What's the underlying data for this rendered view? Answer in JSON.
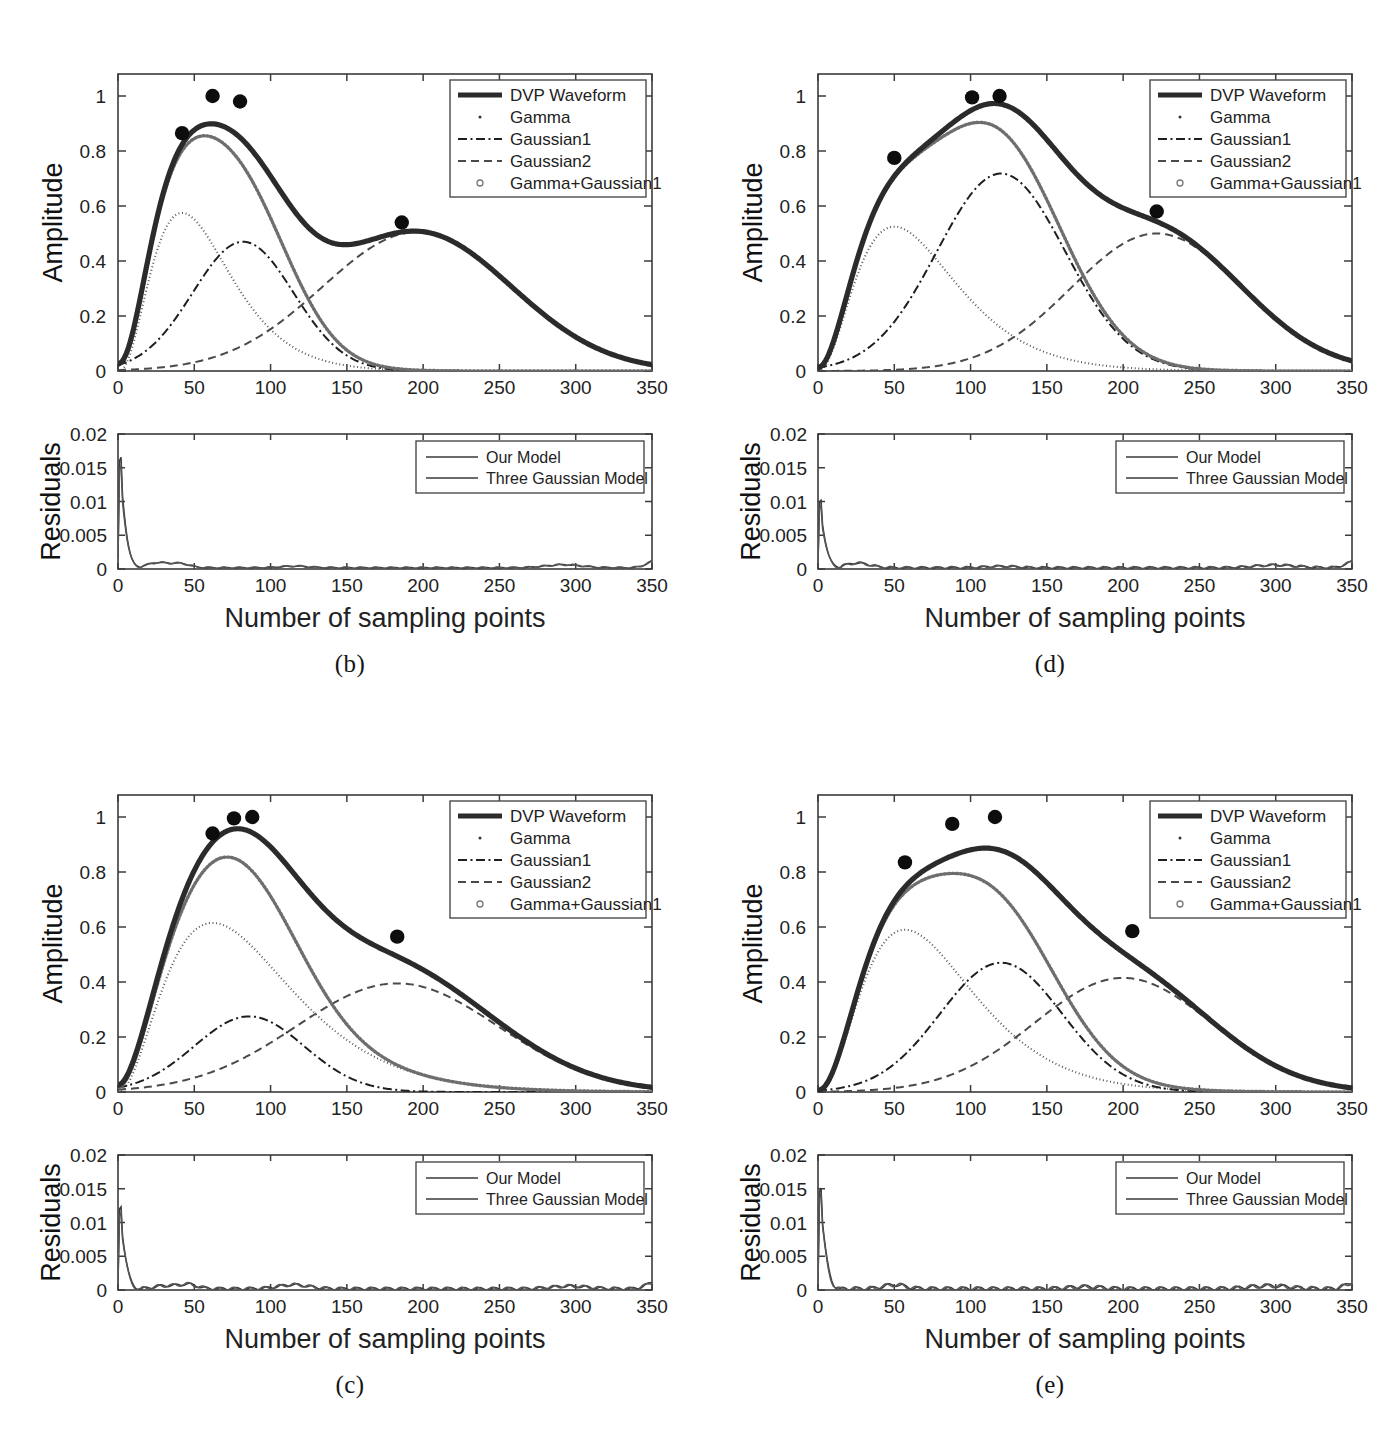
{
  "figure": {
    "panels": [
      {
        "id": "panel-b",
        "caption": "(b)",
        "amplitude": {
          "ylabel": "Amplitude",
          "yticks": [
            "0",
            "0.2",
            "0.4",
            "0.6",
            "0.8",
            "1"
          ],
          "ytickvals": [
            0,
            0.2,
            0.4,
            0.6,
            0.8,
            1
          ],
          "xticks": [
            "0",
            "50",
            "100",
            "150",
            "200",
            "250",
            "300",
            "350"
          ],
          "xtickvals": [
            0,
            50,
            100,
            150,
            200,
            250,
            300,
            350
          ],
          "xlim": [
            0,
            350
          ],
          "ylim": [
            0,
            1.08
          ],
          "legend": [
            {
              "label": "DVP Waveform",
              "style": "solid-thick"
            },
            {
              "label": "Gamma",
              "style": "dot"
            },
            {
              "label": "Gaussian1",
              "style": "dashdot"
            },
            {
              "label": "Gaussian2",
              "style": "dashed"
            },
            {
              "label": "Gamma+Gaussian1",
              "style": "circle"
            }
          ]
        },
        "residuals": {
          "ylabel": "Residuals",
          "xlabel": "Number of sampling points",
          "yticks": [
            "0",
            "0.005",
            "0.01",
            "0.015",
            "0.02"
          ],
          "ytickvals": [
            0,
            0.005,
            0.01,
            0.015,
            0.02
          ],
          "xticks": [
            "0",
            "50",
            "100",
            "150",
            "200",
            "250",
            "300",
            "350"
          ],
          "xtickvals": [
            0,
            50,
            100,
            150,
            200,
            250,
            300,
            350
          ],
          "xlim": [
            0,
            350
          ],
          "ylim": [
            0,
            0.02
          ],
          "legend": [
            {
              "label": "Our Model",
              "style": "solid"
            },
            {
              "label": "Three Gaussian Model",
              "style": "solid"
            }
          ]
        }
      },
      {
        "id": "panel-d",
        "caption": "(d)",
        "amplitude": {
          "ylabel": "Amplitude",
          "yticks": [
            "0",
            "0.2",
            "0.4",
            "0.6",
            "0.8",
            "1"
          ],
          "ytickvals": [
            0,
            0.2,
            0.4,
            0.6,
            0.8,
            1
          ],
          "xticks": [
            "0",
            "50",
            "100",
            "150",
            "200",
            "250",
            "300",
            "350"
          ],
          "xtickvals": [
            0,
            50,
            100,
            150,
            200,
            250,
            300,
            350
          ],
          "xlim": [
            0,
            350
          ],
          "ylim": [
            0,
            1.08
          ],
          "legend": [
            {
              "label": "DVP Waveform",
              "style": "solid-thick"
            },
            {
              "label": "Gamma",
              "style": "dot"
            },
            {
              "label": "Gaussian1",
              "style": "dashdot"
            },
            {
              "label": "Gaussian2",
              "style": "dashed"
            },
            {
              "label": "Gamma+Gaussian1",
              "style": "circle"
            }
          ]
        },
        "residuals": {
          "ylabel": "Residuals",
          "xlabel": "Number of sampling points",
          "yticks": [
            "0",
            "0.005",
            "0.01",
            "0.015",
            "0.02"
          ],
          "ytickvals": [
            0,
            0.005,
            0.01,
            0.015,
            0.02
          ],
          "xticks": [
            "0",
            "50",
            "100",
            "150",
            "200",
            "250",
            "300",
            "350"
          ],
          "xtickvals": [
            0,
            50,
            100,
            150,
            200,
            250,
            300,
            350
          ],
          "xlim": [
            0,
            350
          ],
          "ylim": [
            0,
            0.02
          ],
          "legend": [
            {
              "label": "Our Model",
              "style": "solid"
            },
            {
              "label": "Three Gaussian Model",
              "style": "solid"
            }
          ]
        }
      },
      {
        "id": "panel-c",
        "caption": "(c)",
        "amplitude": {
          "ylabel": "Amplitude",
          "yticks": [
            "0",
            "0.2",
            "0.4",
            "0.6",
            "0.8",
            "1"
          ],
          "ytickvals": [
            0,
            0.2,
            0.4,
            0.6,
            0.8,
            1
          ],
          "xticks": [
            "0",
            "50",
            "100",
            "150",
            "200",
            "250",
            "300",
            "350"
          ],
          "xtickvals": [
            0,
            50,
            100,
            150,
            200,
            250,
            300,
            350
          ],
          "xlim": [
            0,
            350
          ],
          "ylim": [
            0,
            1.08
          ],
          "legend": [
            {
              "label": "DVP Waveform",
              "style": "solid-thick"
            },
            {
              "label": "Gamma",
              "style": "dot"
            },
            {
              "label": "Gaussian1",
              "style": "dashdot"
            },
            {
              "label": "Gaussian2",
              "style": "dashed"
            },
            {
              "label": "Gamma+Gaussian1",
              "style": "circle"
            }
          ]
        },
        "residuals": {
          "ylabel": "Residuals",
          "xlabel": "Number of sampling points",
          "yticks": [
            "0",
            "0.005",
            "0.01",
            "0.015",
            "0.02"
          ],
          "ytickvals": [
            0,
            0.005,
            0.01,
            0.015,
            0.02
          ],
          "xticks": [
            "0",
            "50",
            "100",
            "150",
            "200",
            "250",
            "300",
            "350"
          ],
          "xtickvals": [
            0,
            50,
            100,
            150,
            200,
            250,
            300,
            350
          ],
          "xlim": [
            0,
            350
          ],
          "ylim": [
            0,
            0.02
          ],
          "legend": [
            {
              "label": "Our Model",
              "style": "solid"
            },
            {
              "label": "Three Gaussian Model",
              "style": "solid"
            }
          ]
        }
      },
      {
        "id": "panel-e",
        "caption": "(e)",
        "amplitude": {
          "ylabel": "Amplitude",
          "yticks": [
            "0",
            "0.2",
            "0.4",
            "0.6",
            "0.8",
            "1"
          ],
          "ytickvals": [
            0,
            0.2,
            0.4,
            0.6,
            0.8,
            1
          ],
          "xticks": [
            "0",
            "50",
            "100",
            "150",
            "200",
            "250",
            "300",
            "350"
          ],
          "xtickvals": [
            0,
            50,
            100,
            150,
            200,
            250,
            300,
            350
          ],
          "xlim": [
            0,
            350
          ],
          "ylim": [
            0,
            1.08
          ],
          "legend": [
            {
              "label": "DVP Waveform",
              "style": "solid-thick"
            },
            {
              "label": "Gamma",
              "style": "dot"
            },
            {
              "label": "Gaussian1",
              "style": "dashdot"
            },
            {
              "label": "Gaussian2",
              "style": "dashed"
            },
            {
              "label": "Gamma+Gaussian1",
              "style": "circle"
            }
          ]
        },
        "residuals": {
          "ylabel": "Residuals",
          "xlabel": "Number of sampling points",
          "yticks": [
            "0",
            "0.005",
            "0.01",
            "0.015",
            "0.02"
          ],
          "ytickvals": [
            0,
            0.005,
            0.01,
            0.015,
            0.02
          ],
          "xticks": [
            "0",
            "50",
            "100",
            "150",
            "200",
            "250",
            "300",
            "350"
          ],
          "xtickvals": [
            0,
            50,
            100,
            150,
            200,
            250,
            300,
            350
          ],
          "xlim": [
            0,
            350
          ],
          "ylim": [
            0,
            0.02
          ],
          "legend": [
            {
              "label": "Our Model",
              "style": "solid"
            },
            {
              "label": "Three Gaussian Model",
              "style": "solid"
            }
          ]
        }
      }
    ]
  },
  "chart_data": [
    {
      "panel": "(b)",
      "type": "line",
      "title": "",
      "xlabel": "Number of sampling points",
      "ylabel": "Amplitude",
      "xlim": [
        0,
        350
      ],
      "ylim": [
        0,
        1.08
      ],
      "grid": false,
      "legend_position": "top-right",
      "series": [
        {
          "name": "Gamma",
          "model": "gamma",
          "amp": 0.575,
          "peak": 42,
          "shape": 2.6
        },
        {
          "name": "Gaussian1",
          "model": "gaussian",
          "amp": 0.47,
          "peak": 82,
          "sigma": 33
        },
        {
          "name": "Gaussian2",
          "model": "gaussian",
          "amp": 0.505,
          "peak": 196,
          "sigma": 62
        },
        {
          "name": "Gamma+Gaussian1",
          "model": "sum",
          "parts": [
            0,
            1
          ]
        },
        {
          "name": "DVP Waveform",
          "model": "sum",
          "parts": [
            0,
            1,
            2
          ]
        }
      ],
      "markers": [
        {
          "x": 42,
          "y": 0.865
        },
        {
          "x": 62,
          "y": 1.0
        },
        {
          "x": 80,
          "y": 0.98
        },
        {
          "x": 186,
          "y": 0.54
        }
      ]
    },
    {
      "panel": "(b)-residuals",
      "type": "line",
      "xlabel": "Number of sampling points",
      "ylabel": "Residuals",
      "xlim": [
        0,
        350
      ],
      "ylim": [
        0,
        0.02
      ],
      "grid": false,
      "legend_position": "top-right",
      "series": [
        {
          "name": "Our Model",
          "peak_value": 0.0165,
          "peak_x": 2
        },
        {
          "name": "Three Gaussian Model",
          "peak_value": 0.0165,
          "peak_x": 2
        }
      ],
      "notes": "Both residual traces decay to near zero after x~15; small bumps near 25, 40, 115, 290; slight rise at 350."
    },
    {
      "panel": "(d)",
      "type": "line",
      "xlabel": "Number of sampling points",
      "ylabel": "Amplitude",
      "xlim": [
        0,
        350
      ],
      "ylim": [
        0,
        1.08
      ],
      "grid": false,
      "legend_position": "top-right",
      "series": [
        {
          "name": "Gamma",
          "model": "gamma",
          "amp": 0.525,
          "peak": 50,
          "shape": 2.3
        },
        {
          "name": "Gaussian1",
          "model": "gaussian",
          "amp": 0.718,
          "peak": 120,
          "sigma": 42
        },
        {
          "name": "Gaussian2",
          "model": "gaussian",
          "amp": 0.5,
          "peak": 222,
          "sigma": 56
        },
        {
          "name": "Gamma+Gaussian1",
          "model": "sum",
          "parts": [
            0,
            1
          ]
        },
        {
          "name": "DVP Waveform",
          "model": "sum",
          "parts": [
            0,
            1,
            2
          ]
        }
      ],
      "markers": [
        {
          "x": 50,
          "y": 0.775
        },
        {
          "x": 101,
          "y": 0.995
        },
        {
          "x": 119,
          "y": 1.0
        },
        {
          "x": 222,
          "y": 0.58
        }
      ]
    },
    {
      "panel": "(d)-residuals",
      "type": "line",
      "xlabel": "Number of sampling points",
      "ylabel": "Residuals",
      "xlim": [
        0,
        350
      ],
      "ylim": [
        0,
        0.02
      ],
      "grid": false,
      "legend_position": "top-right",
      "series": [
        {
          "name": "Our Model",
          "peak_value": 0.0102,
          "peak_x": 2
        },
        {
          "name": "Three Gaussian Model",
          "peak_value": 0.0102,
          "peak_x": 2
        }
      ],
      "notes": "Decay to near zero by x~15; small bump near 25; flat thereafter with slight rise at 350."
    },
    {
      "panel": "(c)",
      "type": "line",
      "xlabel": "Number of sampling points",
      "ylabel": "Amplitude",
      "xlim": [
        0,
        350
      ],
      "ylim": [
        0,
        1.08
      ],
      "grid": false,
      "legend_position": "top-right",
      "series": [
        {
          "name": "Gamma",
          "model": "gamma",
          "amp": 0.615,
          "peak": 62,
          "shape": 2.2
        },
        {
          "name": "Gaussian1",
          "model": "gaussian",
          "amp": 0.275,
          "peak": 86,
          "sigma": 36
        },
        {
          "name": "Gaussian2",
          "model": "gaussian",
          "amp": 0.395,
          "peak": 183,
          "sigma": 66
        },
        {
          "name": "Gamma+Gaussian1",
          "model": "sum",
          "parts": [
            0,
            1
          ]
        },
        {
          "name": "DVP Waveform",
          "model": "sum",
          "parts": [
            0,
            1,
            2
          ]
        }
      ],
      "markers": [
        {
          "x": 62,
          "y": 0.94
        },
        {
          "x": 76,
          "y": 0.995
        },
        {
          "x": 88,
          "y": 1.0
        },
        {
          "x": 183,
          "y": 0.565
        }
      ]
    },
    {
      "panel": "(c)-residuals",
      "type": "line",
      "xlabel": "Number of sampling points",
      "ylabel": "Residuals",
      "xlim": [
        0,
        350
      ],
      "ylim": [
        0,
        0.02
      ],
      "grid": false,
      "legend_position": "top-right",
      "series": [
        {
          "name": "Our Model",
          "peak_value": 0.0125,
          "peak_x": 2
        },
        {
          "name": "Three Gaussian Model",
          "peak_value": 0.0125,
          "peak_x": 2
        }
      ],
      "notes": "Decay to near zero by x~18; bumps near 30, 45, 115; slight rise at 350."
    },
    {
      "panel": "(e)",
      "type": "line",
      "xlabel": "Number of sampling points",
      "ylabel": "Amplitude",
      "xlim": [
        0,
        350
      ],
      "ylim": [
        0,
        1.08
      ],
      "grid": false,
      "legend_position": "top-right",
      "series": [
        {
          "name": "Gamma",
          "model": "gamma",
          "amp": 0.59,
          "peak": 57,
          "shape": 2.4
        },
        {
          "name": "Gaussian1",
          "model": "gaussian",
          "amp": 0.47,
          "peak": 120,
          "sigma": 40
        },
        {
          "name": "Gaussian2",
          "model": "gaussian",
          "amp": 0.415,
          "peak": 200,
          "sigma": 58
        },
        {
          "name": "Gamma+Gaussian1",
          "model": "sum",
          "parts": [
            0,
            1
          ]
        },
        {
          "name": "DVP Waveform",
          "model": "sum",
          "parts": [
            0,
            1,
            2
          ]
        }
      ],
      "markers": [
        {
          "x": 57,
          "y": 0.835
        },
        {
          "x": 88,
          "y": 0.975
        },
        {
          "x": 116,
          "y": 1.0
        },
        {
          "x": 206,
          "y": 0.585
        }
      ]
    },
    {
      "panel": "(e)-residuals",
      "type": "line",
      "xlabel": "Number of sampling points",
      "ylabel": "Residuals",
      "xlim": [
        0,
        350
      ],
      "ylim": [
        0,
        0.02
      ],
      "grid": false,
      "legend_position": "top-right",
      "series": [
        {
          "name": "Our Model",
          "peak_value": 0.0153,
          "peak_x": 2
        },
        {
          "name": "Three Gaussian Model",
          "peak_value": 0.0153,
          "peak_x": 2
        }
      ],
      "notes": "Decay to near zero by x~15; small bump near 50; slight rise at 350."
    }
  ]
}
